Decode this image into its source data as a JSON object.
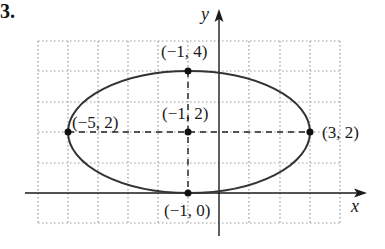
{
  "problem_number": "3.",
  "axes": {
    "x_label": "x",
    "y_label": "y"
  },
  "grid": {
    "x_min": -6,
    "x_max": 4,
    "y_min": -1,
    "y_max": 5,
    "style": "dotted"
  },
  "ellipse": {
    "center": [
      -1,
      2
    ],
    "a": 4,
    "b": 2,
    "color": "#333333"
  },
  "points": [
    {
      "label": "(−1, 4)",
      "x": -1,
      "y": 4
    },
    {
      "label": "(−1, 2)",
      "x": -1,
      "y": 2
    },
    {
      "label": "(−5, 2)",
      "x": -5,
      "y": 2
    },
    {
      "label": "(3, 2)",
      "x": 3,
      "y": 2
    },
    {
      "label": "(−1, 0)",
      "x": -1,
      "y": 0
    }
  ]
}
